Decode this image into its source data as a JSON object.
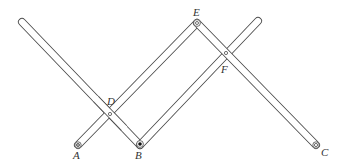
{
  "diagram": {
    "type": "pantograph linkage",
    "colors": {
      "stroke": "#4a4a4a",
      "background": "#ffffff",
      "label": "#333333"
    },
    "labels": {
      "A": "A",
      "B": "B",
      "C": "C",
      "D": "D",
      "E": "E",
      "F": "F"
    },
    "points": {
      "A": [
        78,
        145
      ],
      "B": [
        140,
        145
      ],
      "C": [
        316,
        145
      ],
      "D": [
        110,
        113
      ],
      "E": [
        197,
        23
      ],
      "F": [
        226,
        53
      ]
    },
    "bars": [
      {
        "name": "bar-left-to-B",
        "from": [
          22,
          22
        ],
        "to": [
          140,
          145
        ]
      },
      {
        "name": "bar-A-to-E",
        "from": [
          78,
          145
        ],
        "to": [
          197,
          23
        ]
      },
      {
        "name": "bar-B-to-top-right",
        "from": [
          140,
          145
        ],
        "to": [
          258,
          21
        ]
      },
      {
        "name": "bar-E-to-C",
        "from": [
          197,
          23
        ],
        "to": [
          316,
          145
        ]
      }
    ],
    "pins": {
      "A": "fixed-pivot (double ring)",
      "B": "tracer point (filled dot)",
      "C": "pen point (double ring)",
      "D": "pivot (small ring)",
      "E": "pivot (small ring)",
      "F": "pivot (small ring)"
    }
  }
}
